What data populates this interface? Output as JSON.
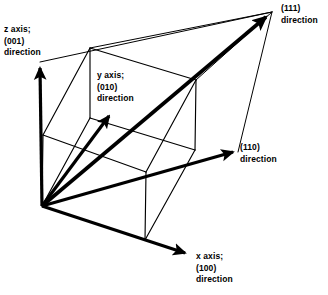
{
  "figure": {
    "background_color": "#ffffff",
    "stroke_color": "#000000",
    "width": 328,
    "height": 295
  },
  "labels": {
    "z_axis": {
      "line1": "z axis;",
      "line2": "(001)",
      "line3": "direction"
    },
    "y_axis": {
      "line1": "y axis;",
      "line2": "(010)",
      "line3": "direction"
    },
    "x_axis": {
      "line1": "x axis;",
      "line2": "(100)",
      "line3": "direction"
    },
    "body_diagonal": {
      "line1": "(111)",
      "line2": "direction"
    },
    "face_diagonal": {
      "line1": "(110)",
      "line2": "direction"
    }
  },
  "geometry": {
    "cube_vertices": {
      "front_bottom_left": [
        42,
        206
      ],
      "front_top_left": [
        43,
        135
      ],
      "front_bottom_right": [
        145,
        240
      ],
      "front_top_right": [
        146,
        172
      ],
      "back_bottom_left": [
        90,
        118
      ],
      "back_top_left": [
        90,
        48
      ],
      "back_bottom_right": [
        195,
        150
      ],
      "back_top_right": [
        196,
        80
      ]
    },
    "arrows": {
      "z_axis_tip": [
        40,
        62
      ],
      "y_axis_tip": [
        113,
        111
      ],
      "x_axis_tip": [
        190,
        256
      ],
      "body_diagonal_tip": [
        272,
        12
      ],
      "face_diagonal_tip": [
        238,
        152
      ]
    },
    "line_weights": {
      "cube_edge": 1,
      "axis": 3.2,
      "diagonal": 3.4
    }
  }
}
